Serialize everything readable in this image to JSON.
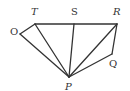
{
  "diagram": {
    "type": "geometry-figure",
    "stroke_color": "#333333",
    "points": {
      "O": {
        "label": "O",
        "x": 20,
        "y": 34,
        "lx": 10,
        "ly": 35
      },
      "T": {
        "label": "T",
        "x": 35,
        "y": 24,
        "lx": 31,
        "ly": 15
      },
      "S": {
        "label": "S",
        "x": 74,
        "y": 24,
        "lx": 71,
        "ly": 15
      },
      "R": {
        "label": "R",
        "x": 117,
        "y": 24,
        "lx": 113,
        "ly": 15
      },
      "Q": {
        "label": "Q",
        "x": 112,
        "y": 54,
        "lx": 109,
        "ly": 67
      },
      "P": {
        "label": "P",
        "x": 69,
        "y": 77,
        "lx": 65,
        "ly": 90
      }
    },
    "segments": [
      [
        "T",
        "R"
      ],
      [
        "O",
        "T"
      ],
      [
        "O",
        "P"
      ],
      [
        "T",
        "P"
      ],
      [
        "S",
        "P"
      ],
      [
        "R",
        "P"
      ],
      [
        "R",
        "Q"
      ],
      [
        "Q",
        "P"
      ]
    ]
  }
}
